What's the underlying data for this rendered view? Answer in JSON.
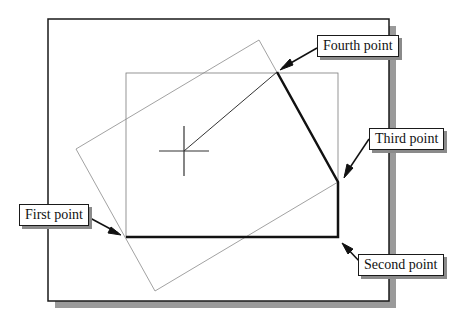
{
  "diagram": {
    "colors": {
      "frame": "#1a1a1a",
      "frame_shadow": "#9a9a9a",
      "thin_line": "#7a7a7a",
      "thick_line": "#111111",
      "background": "#ffffff"
    },
    "outer_frame": {
      "x": 48,
      "y": 19,
      "width": 341,
      "height": 282,
      "shadow_offset": 7
    },
    "inner_rectangle": {
      "x": 126,
      "y": 73,
      "width": 212,
      "height": 164
    },
    "rotated_rectangle": {
      "points": [
        [
          76,
          149
        ],
        [
          259,
          40
        ],
        [
          338,
          182
        ],
        [
          155,
          291
        ]
      ]
    },
    "polyline_points": {
      "first": [
        126,
        237
      ],
      "second": [
        338,
        237
      ],
      "third": [
        338,
        182
      ],
      "fourth": [
        277,
        72
      ]
    },
    "rubber_band_line": {
      "from": [
        277,
        72
      ],
      "to": [
        184,
        151
      ]
    },
    "crosshair": {
      "x": 184,
      "y": 151,
      "size": 25
    },
    "labels": {
      "first_point": "First point",
      "second_point": "Second point",
      "third_point": "Third point",
      "fourth_point": "Fourth point"
    }
  }
}
